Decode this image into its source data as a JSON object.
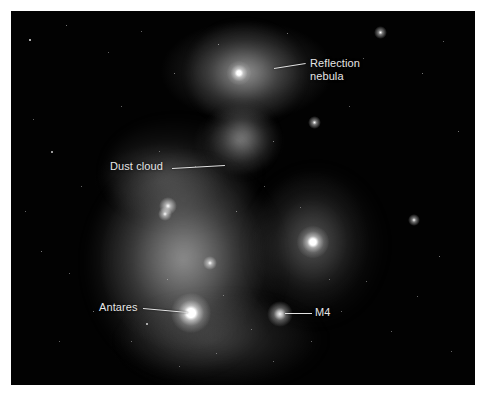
{
  "figure": {
    "kind": "annotated-astrophotograph",
    "background_color": "#ffffff",
    "plate_color": "#000000",
    "label_color": "#e6e6e6",
    "leader_color": "#e3e3e3"
  },
  "plate": {
    "x": 11,
    "y": 11,
    "width": 464,
    "height": 374
  },
  "annotations": [
    {
      "id": "reflection-nebula",
      "label_line1": "Reflection",
      "label_line2": "nebula",
      "label_x": 299,
      "label_y": 46,
      "leader": {
        "x1": 263,
        "y1": 57,
        "x2": 295,
        "y2": 52
      },
      "target": {
        "x": 248,
        "y": 60
      }
    },
    {
      "id": "dust-cloud",
      "label_line1": "Dust cloud",
      "label_line2": "",
      "label_x": 99,
      "label_y": 149,
      "leader": {
        "x1": 161,
        "y1": 157,
        "x2": 214,
        "y2": 154
      },
      "target": {
        "x": 216,
        "y": 154
      }
    },
    {
      "id": "antares",
      "label_line1": "Antares",
      "label_line2": "",
      "label_x": 88,
      "label_y": 290,
      "leader": {
        "x1": 132,
        "y1": 297,
        "x2": 177,
        "y2": 301
      },
      "target": {
        "x": 180,
        "y": 302
      }
    },
    {
      "id": "m4",
      "label_line1": "M4",
      "label_line2": "",
      "label_x": 304,
      "label_y": 295,
      "leader": {
        "x1": 274,
        "y1": 302,
        "x2": 301,
        "y2": 302
      },
      "target": {
        "x": 270,
        "y": 302
      }
    }
  ],
  "features": {
    "bright_stars": [
      {
        "name": "antares",
        "x": 180,
        "y": 302,
        "radius": 9
      },
      {
        "name": "sigma-scorpii",
        "x": 301,
        "y": 230,
        "radius": 6
      },
      {
        "name": "reflection-nebula-core",
        "x": 228,
        "y": 62,
        "radius": 4
      },
      {
        "name": "rho-ophiuchi",
        "x": 158,
        "y": 195,
        "radius": 3
      },
      {
        "name": "m4-cluster",
        "x": 268,
        "y": 302,
        "radius": 5
      }
    ]
  }
}
